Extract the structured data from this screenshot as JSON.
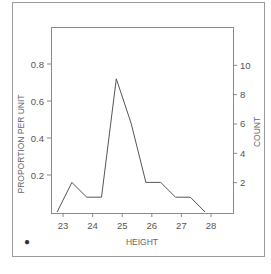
{
  "chart_data": {
    "type": "line",
    "title": "",
    "xlabel": "HEIGHT",
    "ylabel": "PROPORTION PER UNIT",
    "y2label": "COUNT",
    "x": [
      22.8,
      23.3,
      23.8,
      24.3,
      24.8,
      25.3,
      25.8,
      26.3,
      26.8,
      27.3,
      27.8
    ],
    "series": [
      {
        "name": "frequency polygon",
        "count": [
          0,
          2,
          1,
          1,
          9,
          6,
          2,
          2,
          1,
          1,
          0
        ],
        "values": [
          0.0,
          0.16,
          0.08,
          0.08,
          0.72,
          0.48,
          0.16,
          0.16,
          0.08,
          0.08,
          0.0
        ]
      }
    ],
    "xticks": [
      23,
      24,
      25,
      26,
      27,
      28
    ],
    "yticks": [
      "0.2",
      "0.4",
      "0.6",
      "0.8"
    ],
    "y2ticks": [
      "2",
      "4",
      "6",
      "8",
      "10"
    ],
    "xlim": [
      22.6,
      28.7
    ],
    "ylim": [
      0,
      1.0
    ],
    "y2lim": [
      0,
      12.5
    ],
    "grid": false,
    "legend": null
  },
  "panel_marker": "●"
}
